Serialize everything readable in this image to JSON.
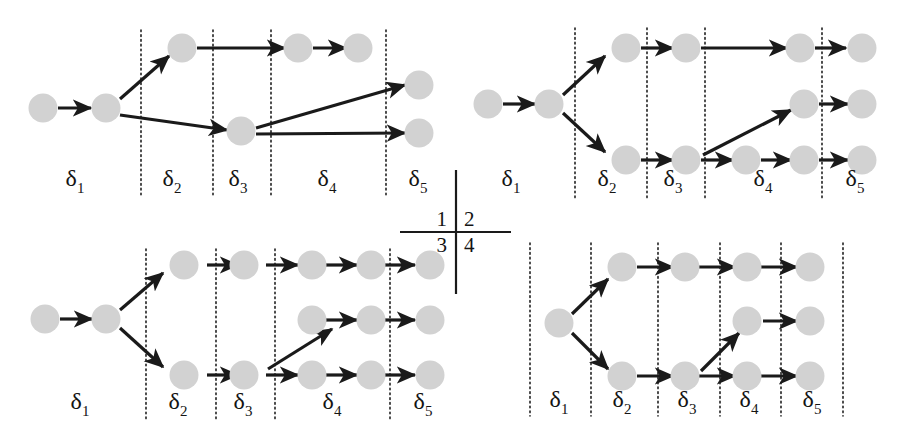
{
  "figure": {
    "title": "",
    "layout": "2x2 quadrant grid of directed trellis graphs",
    "node_color": "#d2d2d2",
    "edge_color": "#1a1a1a",
    "separator_style": "dotted vertical line",
    "stage_labels": [
      "δ₁",
      "δ₂",
      "δ₃",
      "δ₄",
      "δ₅"
    ],
    "stage_label_parts": [
      {
        "base": "δ",
        "sub": "1"
      },
      {
        "base": "δ",
        "sub": "2"
      },
      {
        "base": "δ",
        "sub": "3"
      },
      {
        "base": "δ",
        "sub": "4"
      },
      {
        "base": "δ",
        "sub": "5"
      }
    ]
  },
  "quadrant_key": {
    "name": "quadrant-legend-cross",
    "cells": [
      {
        "id": "q1",
        "label": "1",
        "position": "top-left"
      },
      {
        "id": "q2",
        "label": "2",
        "position": "top-right"
      },
      {
        "id": "q3",
        "label": "3",
        "position": "bottom-left"
      },
      {
        "id": "q4",
        "label": "4",
        "position": "bottom-right"
      }
    ]
  },
  "panels": [
    {
      "id": "panel-1",
      "quadrant": "1",
      "position": "top-left",
      "node_count": 9,
      "edge_count": 8,
      "stage_labels": [
        "δ₁",
        "δ₂",
        "δ₃",
        "δ₄",
        "δ₅"
      ]
    },
    {
      "id": "panel-2",
      "quadrant": "2",
      "position": "top-right",
      "node_count": 12,
      "edge_count": 11,
      "stage_labels": [
        "δ₁",
        "δ₂",
        "δ₃",
        "δ₄",
        "δ₅"
      ]
    },
    {
      "id": "panel-3",
      "quadrant": "3",
      "position": "bottom-left",
      "node_count": 13,
      "edge_count": 12,
      "stage_labels": [
        "δ₁",
        "δ₂",
        "δ₃",
        "δ₄",
        "δ₅"
      ]
    },
    {
      "id": "panel-4",
      "quadrant": "4",
      "position": "bottom-right",
      "node_count": 11,
      "edge_count": 10,
      "stage_labels": [
        "δ₁",
        "δ₂",
        "δ₃",
        "δ₄",
        "δ₅"
      ]
    }
  ]
}
